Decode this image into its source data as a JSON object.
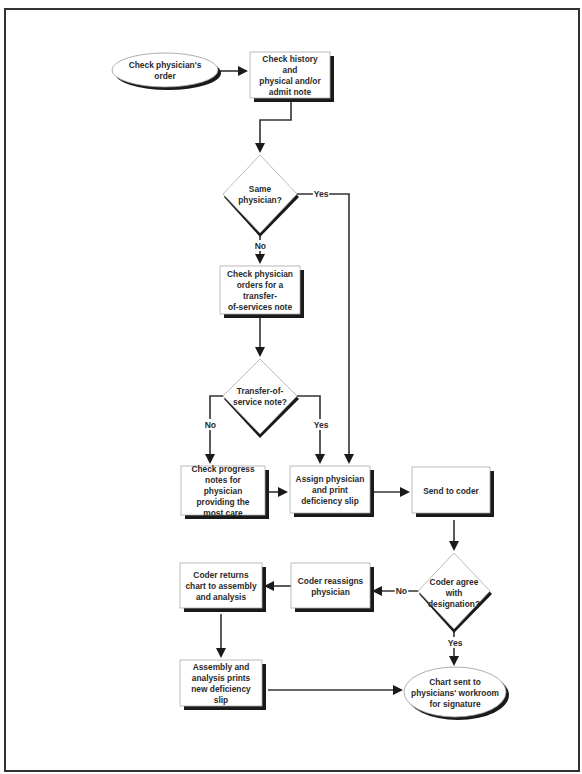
{
  "diagram": {
    "nodes": [
      {
        "id": "n1",
        "shape": "ellipse",
        "text": "Check physician's order"
      },
      {
        "id": "n2",
        "shape": "box",
        "text": "Check history and physical and/or admit note"
      },
      {
        "id": "n3",
        "shape": "diamond",
        "text": "Same physician?"
      },
      {
        "id": "n4",
        "shape": "box",
        "text": "Check physician orders for a transfer-of-services note"
      },
      {
        "id": "n5",
        "shape": "diamond",
        "text": "Transfer-of-service note?"
      },
      {
        "id": "n6",
        "shape": "box",
        "text": "Check progress notes for physician providing the most care"
      },
      {
        "id": "n7",
        "shape": "box",
        "text": "Assign physician and print deficiency slip"
      },
      {
        "id": "n8",
        "shape": "box",
        "text": "Send to coder"
      },
      {
        "id": "n9",
        "shape": "diamond",
        "text": "Coder agree with designation?"
      },
      {
        "id": "n10",
        "shape": "box",
        "text": "Coder reassigns physician"
      },
      {
        "id": "n11",
        "shape": "box",
        "text": "Coder returns chart to assembly and analysis"
      },
      {
        "id": "n12",
        "shape": "box",
        "text": "Assembly and analysis prints new deficiency slip"
      },
      {
        "id": "n13",
        "shape": "ellipse",
        "text": "Chart sent to physicians' workroom for signature"
      }
    ],
    "edges": [
      {
        "from": "n1",
        "to": "n2",
        "label": ""
      },
      {
        "from": "n2",
        "to": "n3",
        "label": ""
      },
      {
        "from": "n3",
        "to": "n7",
        "label": "Yes"
      },
      {
        "from": "n3",
        "to": "n4",
        "label": "No"
      },
      {
        "from": "n4",
        "to": "n5",
        "label": ""
      },
      {
        "from": "n5",
        "to": "n6",
        "label": "No"
      },
      {
        "from": "n5",
        "to": "n7",
        "label": "Yes"
      },
      {
        "from": "n6",
        "to": "n7",
        "label": ""
      },
      {
        "from": "n7",
        "to": "n8",
        "label": ""
      },
      {
        "from": "n8",
        "to": "n9",
        "label": ""
      },
      {
        "from": "n9",
        "to": "n10",
        "label": "No"
      },
      {
        "from": "n9",
        "to": "n13",
        "label": "Yes"
      },
      {
        "from": "n10",
        "to": "n11",
        "label": ""
      },
      {
        "from": "n11",
        "to": "n12",
        "label": ""
      },
      {
        "from": "n12",
        "to": "n13",
        "label": ""
      }
    ],
    "labels": {
      "yes": "Yes",
      "no": "No"
    },
    "lines": {
      "n1": "Check physician's order",
      "n2": [
        "Check history and",
        "physical and/or",
        "admit note"
      ],
      "n3": "Same physician?",
      "n4": [
        "Check physician",
        "orders for a transfer-",
        "of-services note"
      ],
      "n5": [
        "Transfer-of-",
        "service note?"
      ],
      "n6": [
        "Check progress",
        "notes for physician",
        "providing the",
        "most care"
      ],
      "n7": [
        "Assign physician",
        "and print",
        "deficiency slip"
      ],
      "n8": "Send to coder",
      "n9": [
        "Coder agree",
        "with designation?"
      ],
      "n10": [
        "Coder reassigns",
        "physician"
      ],
      "n11": [
        "Coder returns",
        "chart to assembly",
        "and analysis"
      ],
      "n12": [
        "Assembly and",
        "analysis prints",
        "new deficiency slip"
      ],
      "n13": [
        "Chart sent to",
        "physicians' workroom",
        "for signature"
      ]
    },
    "colors": {
      "line": "#333333",
      "shadow": "#1a1a1a",
      "node_fill": "#ffffff",
      "node_border": "#aaaaaa"
    }
  }
}
